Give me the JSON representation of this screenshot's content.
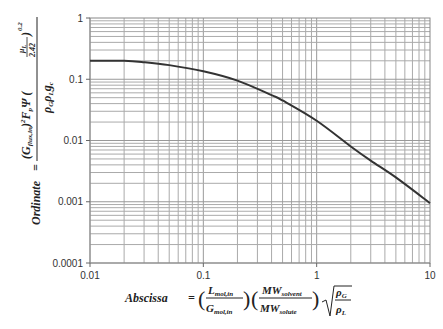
{
  "chart_data": {
    "type": "line",
    "title": "",
    "xlabel": "Abscissa = (L_mol,in / G_mol,in)(MW_solvent / MW_solute) sqrt(rho_G / rho_L)",
    "ylabel": "Ordinate = (G_flux,in)^2 F_p Psi (mu_L / 2.42)^0.2 / (rho_G rho_L g_c)",
    "xscale": "log",
    "yscale": "log",
    "xlim": [
      0.01,
      10
    ],
    "ylim": [
      0.0001,
      1
    ],
    "grid": true,
    "x_ticks": [
      "0.01",
      "0.1",
      "1",
      "10"
    ],
    "y_ticks": [
      "1",
      "0.1",
      "0.01",
      "0.001",
      "0.0001"
    ],
    "series": [
      {
        "name": "flooding curve",
        "x": [
          0.01,
          0.02,
          0.03,
          0.05,
          0.1,
          0.2,
          0.4,
          0.5,
          1,
          2,
          3,
          5,
          10
        ],
        "values": [
          0.2,
          0.2,
          0.19,
          0.17,
          0.135,
          0.095,
          0.055,
          0.045,
          0.021,
          0.008,
          0.0047,
          0.0025,
          0.00095
        ]
      }
    ]
  },
  "labels": {
    "abscissa_word": "Abscissa",
    "ordinate_word": "Ordinate",
    "equals": "="
  }
}
